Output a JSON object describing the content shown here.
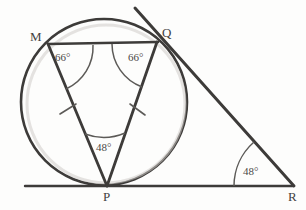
{
  "figure": {
    "stroke_color": "#3d3b39",
    "background_color": "#fdfdfc",
    "vertices": [
      {
        "name": "M",
        "label": "M",
        "x": 48,
        "y": 44
      },
      {
        "name": "Q",
        "label": "Q",
        "x": 157,
        "y": 42
      },
      {
        "name": "P",
        "label": "P",
        "x": 107,
        "y": 186
      },
      {
        "name": "R",
        "label": "R",
        "x": 293,
        "y": 186
      }
    ],
    "vertex_label_positions": [
      {
        "name": "M",
        "left": 30,
        "top": 30
      },
      {
        "name": "Q",
        "left": 162,
        "top": 26
      },
      {
        "name": "P",
        "left": 103,
        "top": 190
      },
      {
        "name": "R",
        "left": 288,
        "top": 190
      }
    ],
    "angles": [
      {
        "name": "angle-at-m",
        "label": "66°",
        "value": 66,
        "left": 55,
        "top": 52
      },
      {
        "name": "angle-at-q",
        "label": "66°",
        "value": 66,
        "left": 128,
        "top": 52
      },
      {
        "name": "angle-at-p",
        "label": "48°",
        "value": 48,
        "left": 96,
        "top": 142
      },
      {
        "name": "angle-at-r",
        "label": "48°",
        "value": 48,
        "left": 243,
        "top": 166
      }
    ],
    "circle": {
      "cx": 104,
      "cy": 102,
      "r": 83
    },
    "baseline": {
      "x1": 25,
      "y1": 186,
      "x2": 293,
      "y2": 186
    },
    "tangent_line": {
      "x1": 135,
      "y1": 8,
      "x2": 293,
      "y2": 186
    },
    "chords": [
      {
        "name": "chord-mq",
        "x1": 48,
        "y1": 44,
        "x2": 157,
        "y2": 42
      },
      {
        "name": "chord-pm",
        "x1": 107,
        "y1": 186,
        "x2": 48,
        "y2": 44
      },
      {
        "name": "chord-pq",
        "x1": 107,
        "y1": 186,
        "x2": 157,
        "y2": 42
      }
    ],
    "tick_marks": [
      {
        "name": "tick-on-pm",
        "x": 68,
        "y": 110
      },
      {
        "name": "tick-on-pq",
        "x": 137,
        "y": 110
      }
    ]
  }
}
